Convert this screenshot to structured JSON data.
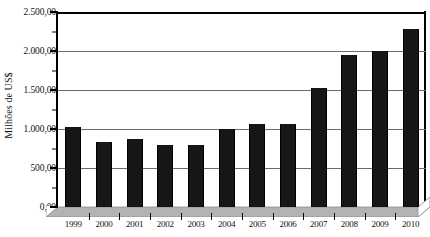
{
  "chart_data": {
    "type": "bar",
    "title": "",
    "subtitle": "",
    "xlabel": "",
    "ylabel": "Milhões de US$",
    "categories": [
      "1999",
      "2000",
      "2001",
      "2002",
      "2003",
      "2004",
      "2005",
      "2006",
      "2007",
      "2008",
      "2009",
      "2010"
    ],
    "values": [
      1030,
      830,
      870,
      790,
      800,
      1000,
      1060,
      1060,
      1530,
      1950,
      2000,
      2280
    ],
    "ylim": [
      0,
      2500
    ],
    "ytick_values": [
      0,
      500,
      1000,
      1500,
      2000,
      2500
    ],
    "ytick_labels": [
      "0,00",
      "500,00",
      "1.000,00",
      "1.500,00",
      "2.000,00",
      "2.500,00"
    ],
    "grid": true,
    "legend": false,
    "legend_position": "none",
    "series": [
      {
        "name": "Milhões de US$",
        "color": "#161616",
        "values": [
          1030,
          830,
          870,
          790,
          800,
          1000,
          1060,
          1060,
          1530,
          1950,
          2000,
          2280
        ]
      }
    ],
    "style": {
      "bar_color": "#161616",
      "gridline_color": "#6b6b6b",
      "axis_color": "#000000",
      "plinth_color": "#b3b3b3",
      "background": "#ffffff",
      "three_d_base": true
    }
  }
}
